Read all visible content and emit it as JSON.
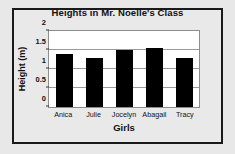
{
  "chart_data": {
    "type": "bar",
    "title": "Heights in Mr. Noelle's Class",
    "xlabel": "Girls",
    "ylabel": "Height (m)",
    "categories": [
      "Anica",
      "Julie",
      "Jocelyn",
      "Abagail",
      "Tracy"
    ],
    "values": [
      1.4,
      1.3,
      1.5,
      1.55,
      1.3
    ],
    "ylim": [
      0,
      2
    ],
    "yticks": [
      "0",
      "0.5",
      "1",
      "1.5",
      "2"
    ],
    "ytick_values": [
      0,
      0.5,
      1,
      1.5,
      2
    ],
    "grid": true,
    "legend": false,
    "bar_color": "#000000",
    "plot_background": "#ffffff",
    "figure_background": "#e8e8e8",
    "border_color": "#1a1a1a",
    "gridline_color": "#9a9a9a",
    "text_color": "#111111"
  }
}
